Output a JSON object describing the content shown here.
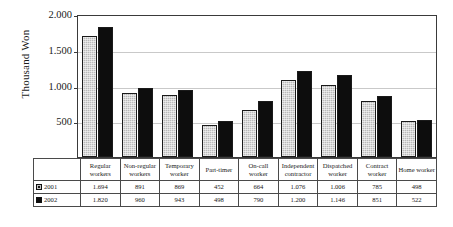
{
  "chart_data": {
    "type": "bar",
    "title": "",
    "xlabel": "",
    "ylabel": "Thousand Won",
    "ylim": [
      0,
      2000
    ],
    "grid": true,
    "legend_position": "table-left",
    "y_ticks": [
      "-",
      "500",
      "1.000",
      "1.500",
      "2.000"
    ],
    "y_tick_values": [
      0,
      500,
      1000,
      1500,
      2000
    ],
    "categories": [
      "Regular workers",
      "Non-regular workers",
      "Temporary worker",
      "Part-timer",
      "On-call worker",
      "Independent contractor",
      "Dispatched worker",
      "Contract worker",
      "Home worker"
    ],
    "category_lines": [
      [
        "Regular",
        "workers"
      ],
      [
        "Non-regular",
        "workers"
      ],
      [
        "Temporary",
        "worker"
      ],
      [
        "Part-timer"
      ],
      [
        "On-call",
        "worker"
      ],
      [
        "Independent",
        "contractor"
      ],
      [
        "Dispatched",
        "worker"
      ],
      [
        "Contract",
        "worker"
      ],
      [
        "Home worker"
      ]
    ],
    "series": [
      {
        "name": "2001",
        "color": "#b9b9b9",
        "values": [
          1694,
          891,
          869,
          452,
          664,
          1076,
          1006,
          785,
          498
        ],
        "labels": [
          "1.694",
          "891",
          "869",
          "452",
          "664",
          "1.076",
          "1.006",
          "785",
          "498"
        ]
      },
      {
        "name": "2002",
        "color": "#0d0d0d",
        "values": [
          1820,
          960,
          943,
          498,
          790,
          1200,
          1146,
          851,
          522
        ],
        "labels": [
          "1.820",
          "960",
          "943",
          "498",
          "790",
          "1.200",
          "1.146",
          "851",
          "522"
        ]
      }
    ]
  }
}
